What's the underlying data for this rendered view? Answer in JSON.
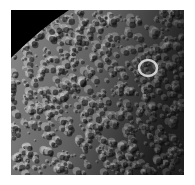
{
  "image": {
    "subject": "cratered moon surface",
    "description": "Grayscale spacecraft photograph of a heavily cratered icy moon surface with dark space in the upper-left corner and a bright crater rim at upper right",
    "colors": {
      "space": "#000000",
      "surface_light": "#c8c8c8",
      "surface_mid": "#7a7a7a",
      "surface_dark": "#1c1c1c",
      "background": "#ffffff"
    }
  }
}
